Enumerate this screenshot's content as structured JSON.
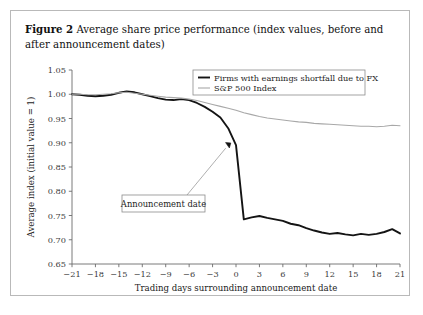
{
  "figure": {
    "label": "Figure 2",
    "caption": "Average share price performance (index values, before and after announcement dates)"
  },
  "annotation": {
    "text": "Announcement date",
    "point_x": -1,
    "point_y": 0.895
  },
  "chart_data": {
    "type": "line",
    "title": "Average share price performance (index values, before and after announcement dates)",
    "xlabel": "Trading days surrounding announcement date",
    "ylabel": "Average index (initial value = 1)",
    "xlim": [
      -21,
      21
    ],
    "ylim": [
      0.65,
      1.05
    ],
    "xticks": [
      -21,
      -18,
      -15,
      -12,
      -9,
      -6,
      -3,
      0,
      3,
      6,
      9,
      12,
      15,
      18,
      21
    ],
    "yticks": [
      0.65,
      0.7,
      0.75,
      0.8,
      0.85,
      0.9,
      0.95,
      1.0,
      1.05
    ],
    "ytick_labels": [
      "0.65",
      "0.70",
      "0.75",
      "0.80",
      "0.85",
      "0.90",
      "0.95",
      "1.00",
      "1.05"
    ],
    "xtick_labels": [
      "−21",
      "−18",
      "−15",
      "−12",
      "−9",
      "−6",
      "−3",
      "0",
      "3",
      "6",
      "9",
      "12",
      "15",
      "18",
      "21"
    ],
    "grid": false,
    "legend_position": "top-right",
    "x": [
      -21,
      -20,
      -19,
      -18,
      -17,
      -16,
      -15,
      -14,
      -13,
      -12,
      -11,
      -10,
      -9,
      -8,
      -7,
      -6,
      -5,
      -4,
      -3,
      -2,
      -1,
      0,
      1,
      2,
      3,
      4,
      5,
      6,
      7,
      8,
      9,
      10,
      11,
      12,
      13,
      14,
      15,
      16,
      17,
      18,
      19,
      20,
      21
    ],
    "series": [
      {
        "name": "Firms with earnings shortfall due to FX",
        "color": "#141414",
        "width": 1.9,
        "values": [
          1.0,
          0.999,
          0.997,
          0.996,
          0.997,
          0.999,
          1.003,
          1.006,
          1.004,
          1.0,
          0.996,
          0.992,
          0.989,
          0.988,
          0.99,
          0.988,
          0.982,
          0.974,
          0.964,
          0.952,
          0.93,
          0.895,
          0.742,
          0.746,
          0.749,
          0.745,
          0.742,
          0.739,
          0.733,
          0.73,
          0.724,
          0.719,
          0.715,
          0.712,
          0.714,
          0.711,
          0.709,
          0.712,
          0.71,
          0.712,
          0.716,
          0.722,
          0.713
        ]
      },
      {
        "name": "S&P 500 Index",
        "color": "#a8a8a8",
        "width": 1.1,
        "values": [
          1.0,
          1.0,
          0.999,
          0.999,
          1.0,
          1.001,
          1.003,
          1.004,
          1.002,
          1.0,
          0.998,
          0.996,
          0.994,
          0.993,
          0.992,
          0.99,
          0.987,
          0.983,
          0.979,
          0.975,
          0.971,
          0.967,
          0.962,
          0.958,
          0.954,
          0.951,
          0.949,
          0.947,
          0.945,
          0.943,
          0.942,
          0.94,
          0.939,
          0.938,
          0.937,
          0.936,
          0.935,
          0.934,
          0.934,
          0.933,
          0.934,
          0.936,
          0.935
        ]
      }
    ],
    "annotations": [
      {
        "text": "Announcement date",
        "x": -1,
        "y": 0.895
      }
    ]
  },
  "legend": {
    "items": [
      {
        "label": "Firms with earnings shortfall due to FX"
      },
      {
        "label": "S&P 500 Index"
      }
    ]
  },
  "axes": {
    "x_title": "Trading days surrounding announcement date",
    "y_title": "Average index (initial value = 1)"
  }
}
